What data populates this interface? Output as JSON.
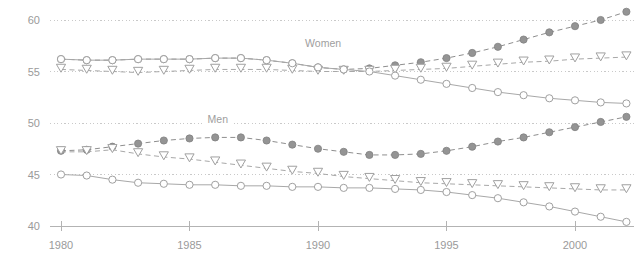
{
  "chart_data": {
    "type": "line",
    "title": "",
    "subtitle": "",
    "xlabel": "",
    "ylabel": "",
    "xlim": [
      1979.6,
      2001.8
    ],
    "ylim": [
      40,
      61.5
    ],
    "grid": true,
    "legend_position": "inline-annotation",
    "x_ticks": [
      1980,
      1985,
      1990,
      1995,
      2000
    ],
    "x_tick_labels": [
      "1980",
      "1985",
      "1990",
      "1995",
      "2000"
    ],
    "y_ticks": [
      40,
      45,
      50,
      55,
      60
    ],
    "y_tick_labels": [
      "40",
      "45",
      "50",
      "55",
      "60"
    ],
    "annotations": [
      {
        "text": "Women",
        "x": 1990.2,
        "y": 57.4
      },
      {
        "text": "Men",
        "x": 1986.1,
        "y": 50.0
      }
    ],
    "x": [
      1980,
      1981,
      1982,
      1983,
      1984,
      1985,
      1986,
      1987,
      1988,
      1989,
      1990,
      1991,
      1992,
      1993,
      1994,
      1995,
      1996,
      1997,
      1998,
      1999,
      2000,
      2001,
      2002
    ],
    "series": [
      {
        "name": "Women - filled circle",
        "group": "Women",
        "marker": "filled-circle",
        "line_style": "dashed",
        "color": "#8e8e8e",
        "values": [
          56.2,
          56.1,
          56.1,
          56.2,
          56.2,
          56.2,
          56.3,
          56.3,
          56.1,
          55.8,
          55.4,
          55.2,
          55.3,
          55.6,
          55.9,
          56.3,
          56.8,
          57.4,
          58.1,
          58.8,
          59.4,
          60.0,
          60.8
        ]
      },
      {
        "name": "Women - open triangle",
        "group": "Women",
        "marker": "open-triangle-down",
        "line_style": "dashed",
        "color": "#a8a8a8",
        "values": [
          55.2,
          55.1,
          55.0,
          54.9,
          55.0,
          55.1,
          55.2,
          55.2,
          55.2,
          55.1,
          55.0,
          55.0,
          55.0,
          55.1,
          55.2,
          55.3,
          55.5,
          55.7,
          55.9,
          56.0,
          56.2,
          56.3,
          56.4
        ]
      },
      {
        "name": "Women - open circle",
        "group": "Women",
        "marker": "open-circle",
        "line_style": "solid",
        "color": "#a8a8a8",
        "values": [
          56.2,
          56.1,
          56.1,
          56.2,
          56.2,
          56.2,
          56.3,
          56.3,
          56.1,
          55.8,
          55.4,
          55.2,
          55.0,
          54.6,
          54.2,
          53.8,
          53.4,
          53.0,
          52.7,
          52.4,
          52.2,
          52.0,
          51.9
        ]
      },
      {
        "name": "Men - filled circle",
        "group": "Men",
        "marker": "filled-circle",
        "line_style": "dashed",
        "color": "#8e8e8e",
        "values": [
          47.3,
          47.4,
          47.7,
          48.0,
          48.3,
          48.5,
          48.6,
          48.6,
          48.3,
          47.9,
          47.5,
          47.2,
          46.9,
          46.9,
          47.0,
          47.3,
          47.7,
          48.2,
          48.6,
          49.1,
          49.6,
          50.1,
          50.6
        ]
      },
      {
        "name": "Men - open triangle",
        "group": "Men",
        "marker": "open-triangle-down",
        "line_style": "dashed",
        "color": "#a8a8a8",
        "values": [
          47.2,
          47.2,
          47.4,
          47.0,
          46.7,
          46.5,
          46.2,
          45.9,
          45.6,
          45.3,
          45.1,
          44.8,
          44.6,
          44.4,
          44.2,
          44.1,
          44.0,
          43.9,
          43.8,
          43.7,
          43.6,
          43.5,
          43.5
        ]
      },
      {
        "name": "Men - open circle",
        "group": "Men",
        "marker": "open-circle",
        "line_style": "solid",
        "color": "#a8a8a8",
        "values": [
          45.0,
          44.9,
          44.5,
          44.2,
          44.1,
          44.0,
          44.0,
          43.9,
          43.9,
          43.8,
          43.8,
          43.7,
          43.7,
          43.6,
          43.5,
          43.3,
          43.0,
          42.7,
          42.3,
          41.9,
          41.4,
          40.9,
          40.4
        ]
      }
    ]
  }
}
